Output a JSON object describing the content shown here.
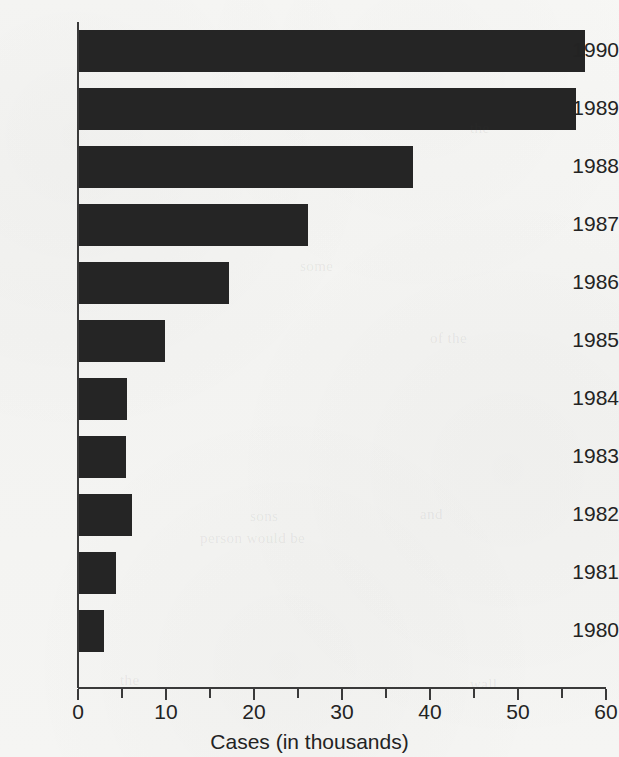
{
  "chart_data": {
    "type": "bar",
    "orientation": "horizontal",
    "title": "",
    "xlabel": "Cases (in thousands)",
    "ylabel": "",
    "xlim": [
      0,
      60
    ],
    "xticks": [
      0,
      10,
      20,
      30,
      40,
      50,
      60
    ],
    "xtick_labels": [
      "0",
      "10",
      "20",
      "30",
      "40",
      "50",
      "60"
    ],
    "minor_tick_interval": 5,
    "grid": false,
    "legend": false,
    "bar_color": "#252525",
    "axis_color": "#3a3a3a",
    "background_color": "#f4f4f2",
    "categories": [
      "1990",
      "1989",
      "1988",
      "1987",
      "1986",
      "1985",
      "1984",
      "1983",
      "1982",
      "1981",
      "1980"
    ],
    "values": [
      57.5,
      56.5,
      38.0,
      26.0,
      17.0,
      9.8,
      5.5,
      5.3,
      6.0,
      4.2,
      2.8
    ],
    "series": [
      {
        "name": "Cases",
        "values": [
          57.5,
          56.5,
          38.0,
          26.0,
          17.0,
          9.8,
          5.5,
          5.3,
          6.0,
          4.2,
          2.8
        ]
      }
    ]
  },
  "bleed_through": [
    {
      "text": "the",
      "x": 470,
      "y": 120
    },
    {
      "text": "some",
      "x": 300,
      "y": 258
    },
    {
      "text": "of the",
      "x": 430,
      "y": 330
    },
    {
      "text": "sons",
      "x": 250,
      "y": 508
    },
    {
      "text": "and",
      "x": 420,
      "y": 506
    },
    {
      "text": "person would be",
      "x": 200,
      "y": 530
    },
    {
      "text": "the",
      "x": 120,
      "y": 672
    },
    {
      "text": "wall",
      "x": 470,
      "y": 676
    }
  ]
}
